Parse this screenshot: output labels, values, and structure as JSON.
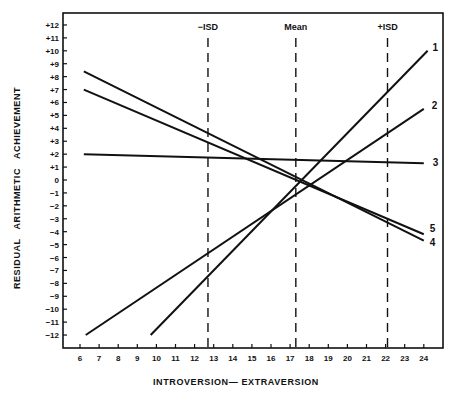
{
  "chart_data": {
    "type": "line",
    "title": "",
    "xlabel": "INTROVERSION— EXTRAVERSION",
    "ylabel": "RESIDUAL   ARITHMETIC   ACHIEVEMENT",
    "x_ticks": [
      "6",
      "7",
      "8",
      "9",
      "10",
      "11",
      "12",
      "13",
      "14",
      "15",
      "16",
      "17",
      "18",
      "19",
      "20",
      "21",
      "22",
      "23",
      "24"
    ],
    "y_ticks": [
      "+12",
      "+11",
      "+10",
      "+9",
      "+8",
      "+7",
      "+6",
      "+5",
      "+4",
      "+3",
      "+2",
      "+1",
      "0",
      "-1",
      "-2",
      "-3",
      "-4",
      "-5",
      "-6",
      "-7",
      "-8",
      "-9",
      "-10",
      "-11",
      "-12"
    ],
    "xlim": [
      5.05,
      25
    ],
    "ylim": [
      -13,
      13
    ],
    "grid": false,
    "legend": "inline labels at right end of each line",
    "reference_lines": [
      {
        "label": "−ISD",
        "x": 12.7,
        "style": "dashed"
      },
      {
        "label": "Mean",
        "x": 17.3,
        "style": "dashed"
      },
      {
        "label": "+ISD",
        "x": 22.1,
        "style": "dashed"
      }
    ],
    "series": [
      {
        "name": "1",
        "x": [
          9.7,
          24.2
        ],
        "y": [
          -12,
          10
        ]
      },
      {
        "name": "2",
        "x": [
          6.3,
          24.0
        ],
        "y": [
          -12,
          5.5
        ]
      },
      {
        "name": "3",
        "x": [
          6.2,
          24.0
        ],
        "y": [
          2,
          1.3
        ]
      },
      {
        "name": "4",
        "x": [
          6.2,
          24.0
        ],
        "y": [
          8.4,
          -4.7
        ]
      },
      {
        "name": "5",
        "x": [
          6.2,
          24.0
        ],
        "y": [
          7.0,
          -4.2
        ]
      }
    ]
  }
}
